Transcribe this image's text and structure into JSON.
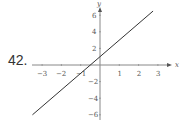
{
  "problem": {
    "number": "42."
  },
  "chart_data": {
    "type": "line",
    "title": "",
    "xlabel": "x",
    "ylabel": "y",
    "xlim": [
      -3.5,
      3.3
    ],
    "ylim": [
      -6.3,
      6.5
    ],
    "x_ticks": [
      -3,
      -2,
      -1,
      1,
      2,
      3
    ],
    "y_ticks": [
      -6,
      -4,
      -2,
      2,
      4,
      6
    ],
    "x_tick_labels": [
      "−3",
      "−2",
      "−1",
      "1",
      "2",
      "3"
    ],
    "y_tick_labels": [
      "−6",
      "−4",
      "−2",
      "2",
      "4",
      "6"
    ],
    "grid": false,
    "series": [
      {
        "name": "y = 2x + 1",
        "x": [
          -3.5,
          2.75
        ],
        "y": [
          -6,
          6.5
        ],
        "color": "#333333"
      }
    ],
    "colors": {
      "axis": "#888888",
      "line": "#333333",
      "text": "#555555"
    }
  }
}
